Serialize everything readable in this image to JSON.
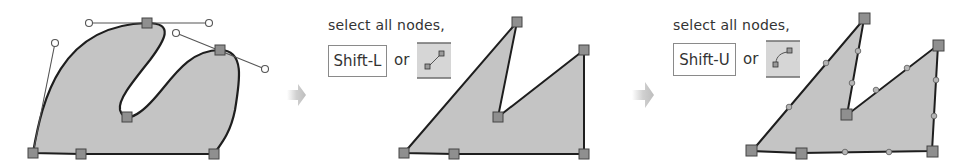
{
  "colors": {
    "fill": "#c4c4c4",
    "stroke": "#1e1e1e",
    "node_fill": "#8f8f8f",
    "node_stroke": "#444444",
    "handle_line": "#555555",
    "arrow": "#c8c8c8",
    "icon_bg": "#d6d6d6",
    "icon_rule": "#6e6e6e"
  },
  "steps": [
    {
      "id": "original-curve",
      "caption": null
    },
    {
      "id": "make-lines",
      "caption": "select all nodes,",
      "shortcut": "Shift-L",
      "or_label": "or",
      "icon": "make-segments-lines-icon"
    },
    {
      "id": "make-curves",
      "caption": "select all nodes,",
      "shortcut": "Shift-U",
      "or_label": "or",
      "icon": "make-segments-curves-icon"
    }
  ]
}
